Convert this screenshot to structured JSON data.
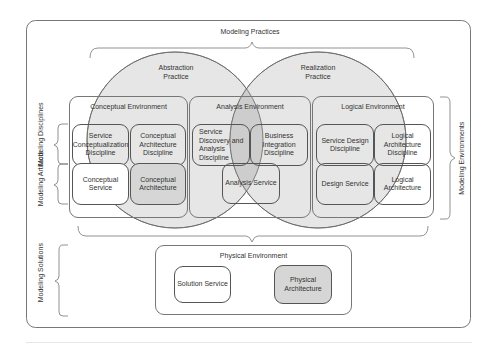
{
  "title": "Modeling Practices",
  "practices": [
    {
      "id": "abstraction",
      "label": "Abstraction Practice"
    },
    {
      "id": "realization",
      "label": "Realization Practice"
    }
  ],
  "side_labels": {
    "disciplines": "Modeling Disciplines",
    "artifacts": "Modeling Artifacts",
    "solutions": "Modeling Solutions",
    "environments": "Modeling Environments"
  },
  "environments": {
    "conceptual": {
      "label": "Conceptual Environment",
      "disciplines": [
        "Service Conceptualization Discipline",
        "Conceptual Architecture Discipline"
      ],
      "artifacts": [
        "Conceptual Service",
        "Conceptual Architecture"
      ]
    },
    "analysis": {
      "label": "Analysis Environment",
      "disciplines": [
        "Service Discovery and Analysis Discipline",
        "Business Integration Discipline"
      ],
      "artifacts": [
        "Analysis Service"
      ]
    },
    "logical": {
      "label": "Logical Environment",
      "disciplines": [
        "Service Design Discipline",
        "Logical Architecture Discipline"
      ],
      "artifacts": [
        "Design Service",
        "Logical Architecture"
      ]
    },
    "physical": {
      "label": "Physical Environment",
      "artifacts": [
        "Solution Service",
        "Physical Architecture"
      ]
    }
  },
  "colors": {
    "circle_fill": "#e4e4e4",
    "overlap_fill": "#cfcfcf",
    "shaded_box": "#d6d6d6",
    "stroke": "#555555"
  }
}
